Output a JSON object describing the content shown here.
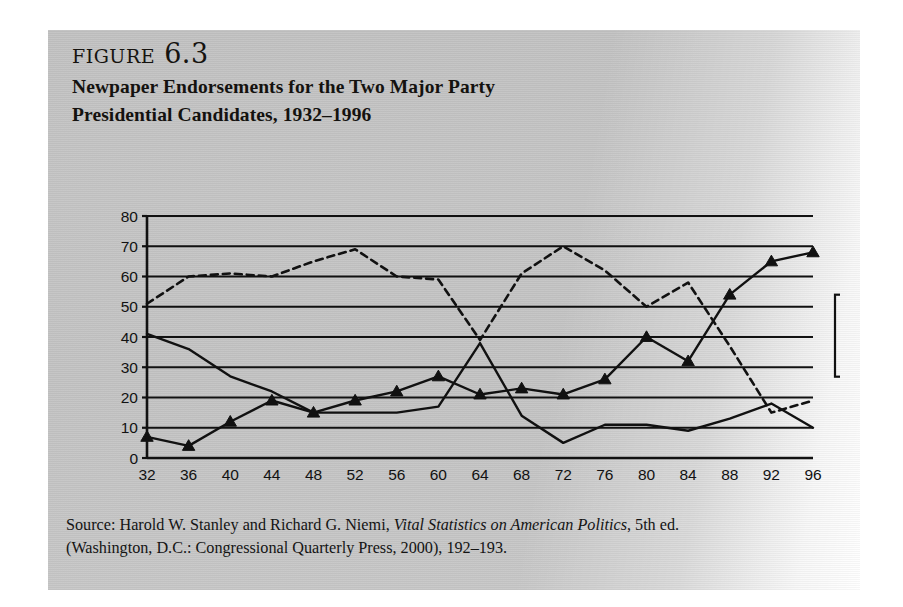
{
  "figure": {
    "number_label": "figure 6.3",
    "title_line1": "Newpaper Endorsements for the Two Major Party",
    "title_line2": "Presidential Candidates, 1932–1996"
  },
  "source": {
    "line1_pre": "Source: Harold W. Stanley and Richard G. Niemi, ",
    "line1_italic": "Vital Statistics on American Politics",
    "line1_post": ", 5th ed.",
    "line2": "(Washington, D.C.: Congressional Quarterly Press, 2000), 192–193."
  },
  "chart_data": {
    "type": "line",
    "title": "Newpaper Endorsements for the Two Major Party Presidential Candidates, 1932–1996",
    "xlabel": "",
    "ylabel": "",
    "xlim": [
      32,
      96
    ],
    "ylim": [
      0,
      80
    ],
    "ytick_step": 10,
    "grid": true,
    "legend_position": "right",
    "categories": [
      32,
      36,
      40,
      44,
      48,
      52,
      56,
      60,
      64,
      68,
      72,
      76,
      80,
      84,
      88,
      92,
      96
    ],
    "xtick_labels": [
      "32",
      "36",
      "40",
      "44",
      "48",
      "52",
      "56",
      "60",
      "64",
      "68",
      "72",
      "76",
      "80",
      "84",
      "88",
      "92",
      "96"
    ],
    "ytick_labels": [
      "0",
      "10",
      "20",
      "30",
      "40",
      "50",
      "60",
      "70",
      "80"
    ],
    "series": [
      {
        "name": "Republican",
        "style": "dashed",
        "marker": "none",
        "color": "#111111",
        "values": [
          51,
          60,
          61,
          60,
          65,
          69,
          60,
          59,
          39,
          61,
          70,
          62,
          50,
          58,
          37,
          15,
          19
        ]
      },
      {
        "name": "Democratic",
        "style": "solid",
        "marker": "none",
        "color": "#111111",
        "values": [
          41,
          36,
          27,
          22,
          15,
          15,
          15,
          17,
          38,
          14,
          5,
          11,
          11,
          9,
          13,
          18,
          10
        ]
      },
      {
        "name": "Uncommitted",
        "style": "solid",
        "marker": "triangle",
        "color": "#111111",
        "values": [
          7,
          4,
          12,
          19,
          15,
          19,
          22,
          27,
          21,
          23,
          21,
          26,
          40,
          32,
          54,
          65,
          68
        ]
      }
    ]
  },
  "legend": {
    "items": [
      {
        "label": "Republican",
        "swatch": "dashed-line-swatch"
      },
      {
        "label": "Democratic",
        "swatch": "solid-line-swatch"
      },
      {
        "label": "Uncommitted",
        "swatch": "triangle-marker-swatch"
      }
    ]
  }
}
